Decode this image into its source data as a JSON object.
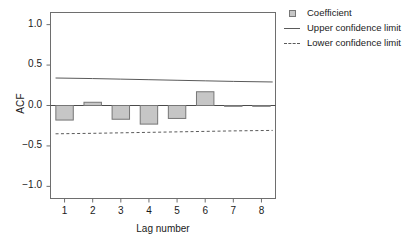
{
  "chart_data": {
    "type": "bar",
    "title": "",
    "xlabel": "Lag number",
    "ylabel": "ACF",
    "categories": [
      "1",
      "2",
      "3",
      "4",
      "5",
      "6",
      "7",
      "8"
    ],
    "values": [
      -0.18,
      0.04,
      -0.17,
      -0.23,
      -0.16,
      0.17,
      -0.005,
      -0.005
    ],
    "series": [
      {
        "name": "Coefficient",
        "type": "bar",
        "values": [
          -0.18,
          0.04,
          -0.17,
          -0.23,
          -0.16,
          0.17,
          -0.005,
          -0.005
        ]
      },
      {
        "name": "Upper confidence limit",
        "type": "line",
        "values": [
          0.34,
          0.333,
          0.326,
          0.319,
          0.312,
          0.305,
          0.298,
          0.291
        ]
      },
      {
        "name": "Lower confidence limit",
        "type": "line",
        "values": [
          -0.35,
          -0.344,
          -0.338,
          -0.332,
          -0.326,
          -0.32,
          -0.314,
          -0.308
        ]
      }
    ],
    "ylim": [
      -1.15,
      1.15
    ],
    "yticks": [
      1.0,
      0.5,
      0.0,
      -0.5,
      -1.0
    ],
    "ytick_labels": [
      "1.0",
      "0.5",
      "0.0",
      "-0.5",
      "-1.0"
    ],
    "xtick_labels": [
      "1",
      "2",
      "3",
      "4",
      "5",
      "6",
      "7",
      "8"
    ],
    "grid": false,
    "legend_position": "right-top",
    "colors": {
      "bar_fill": "#c6c6c6",
      "bar_edge": "#767676",
      "upper_limit_line": "#5a5a5a",
      "lower_limit_line": "#5a5a5a",
      "axis": "#6e6e6e",
      "zero_line": "#4a4a4a",
      "text": "#1a1a1a"
    }
  },
  "legend": {
    "items": [
      {
        "label": "Coefficient",
        "marker": "square-swatch-icon"
      },
      {
        "label": "Upper confidence limit",
        "marker": "solid-line-icon"
      },
      {
        "label": "Lower confidence limit",
        "marker": "dashed-line-icon"
      }
    ]
  }
}
